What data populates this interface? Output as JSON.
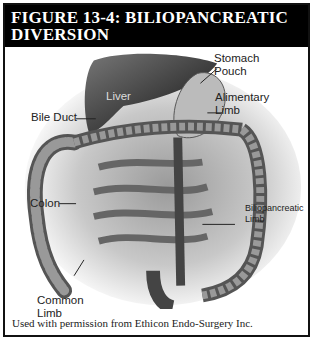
{
  "figure": {
    "title_line1": "FIGURE 13-4: BILIOPANCREATIC",
    "title_line2": "DIVERSION",
    "credit": "Used with permission from Ethicon Endo-Surgery Inc."
  },
  "labels": {
    "stomach_pouch_1": "Stomach",
    "stomach_pouch_2": "Pouch",
    "liver": "Liver",
    "alimentary_limb_1": "Alimentary",
    "alimentary_limb_2": "Limb",
    "bile_duct": "Bile Duct",
    "colon": "Colon",
    "biliopancreatic_limb_1": "Biliopancreatic",
    "biliopancreatic_limb_2": "Limb",
    "common_limb_1": "Common",
    "common_limb_2": "Limb"
  }
}
